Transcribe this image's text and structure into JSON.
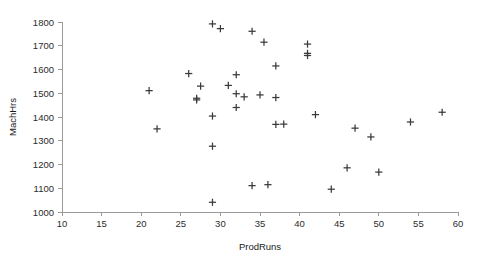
{
  "chart_data": {
    "type": "scatter",
    "title": "",
    "xlabel": "ProdRuns",
    "ylabel": "MachHrs",
    "xlim": [
      10,
      60
    ],
    "ylim": [
      1000,
      1800
    ],
    "xticks": [
      10,
      15,
      20,
      25,
      30,
      35,
      40,
      45,
      50,
      55,
      60
    ],
    "yticks": [
      1000,
      1100,
      1200,
      1300,
      1400,
      1500,
      1600,
      1700,
      1800
    ],
    "xtick_labels": [
      "10",
      "15",
      "20",
      "25",
      "30",
      "35",
      "40",
      "45",
      "50",
      "55",
      "60"
    ],
    "ytick_labels": [
      "1000",
      "1100",
      "1200",
      "1300",
      "1400",
      "1500",
      "1600",
      "1700",
      "1800"
    ],
    "grid": false,
    "legend": false,
    "marker": "plus",
    "marker_color": "#3a3a3a",
    "axis_color": "#9a9a9a",
    "points": [
      {
        "x": 21,
        "y": 1511
      },
      {
        "x": 22,
        "y": 1350
      },
      {
        "x": 26,
        "y": 1583
      },
      {
        "x": 27,
        "y": 1479
      },
      {
        "x": 27,
        "y": 1472
      },
      {
        "x": 27.5,
        "y": 1530
      },
      {
        "x": 29,
        "y": 1792
      },
      {
        "x": 29,
        "y": 1404
      },
      {
        "x": 29,
        "y": 1277
      },
      {
        "x": 29,
        "y": 1041
      },
      {
        "x": 30,
        "y": 1772
      },
      {
        "x": 31,
        "y": 1533
      },
      {
        "x": 32,
        "y": 1578
      },
      {
        "x": 32,
        "y": 1498
      },
      {
        "x": 32,
        "y": 1440
      },
      {
        "x": 33,
        "y": 1485
      },
      {
        "x": 34,
        "y": 1761
      },
      {
        "x": 34,
        "y": 1111
      },
      {
        "x": 35,
        "y": 1493
      },
      {
        "x": 35.5,
        "y": 1715
      },
      {
        "x": 36,
        "y": 1115
      },
      {
        "x": 37,
        "y": 1615
      },
      {
        "x": 37,
        "y": 1482
      },
      {
        "x": 37,
        "y": 1369
      },
      {
        "x": 38,
        "y": 1370
      },
      {
        "x": 41,
        "y": 1707
      },
      {
        "x": 41,
        "y": 1668
      },
      {
        "x": 41,
        "y": 1659
      },
      {
        "x": 42,
        "y": 1410
      },
      {
        "x": 44,
        "y": 1096
      },
      {
        "x": 46,
        "y": 1186
      },
      {
        "x": 47,
        "y": 1353
      },
      {
        "x": 49,
        "y": 1316
      },
      {
        "x": 50,
        "y": 1168
      },
      {
        "x": 54,
        "y": 1379
      },
      {
        "x": 58,
        "y": 1420
      }
    ]
  }
}
